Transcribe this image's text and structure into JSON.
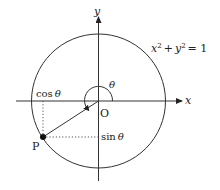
{
  "diagram": {
    "equation": {
      "base_x": "x",
      "sup_x": "2",
      "plus": "+",
      "base_y": "y",
      "sup_y": "2",
      "rest": "= 1"
    },
    "axes": {
      "x_label": "x",
      "y_label": "y"
    },
    "origin_label": "O",
    "angle_label": "θ",
    "point_label": "P",
    "cos_label": {
      "fn": "cos",
      "arg": "θ"
    },
    "sin_label": {
      "fn": "sin",
      "arg": "θ"
    },
    "colors": {
      "stroke": "#222222",
      "dotted": "#555555",
      "background": "#ffffff"
    }
  }
}
